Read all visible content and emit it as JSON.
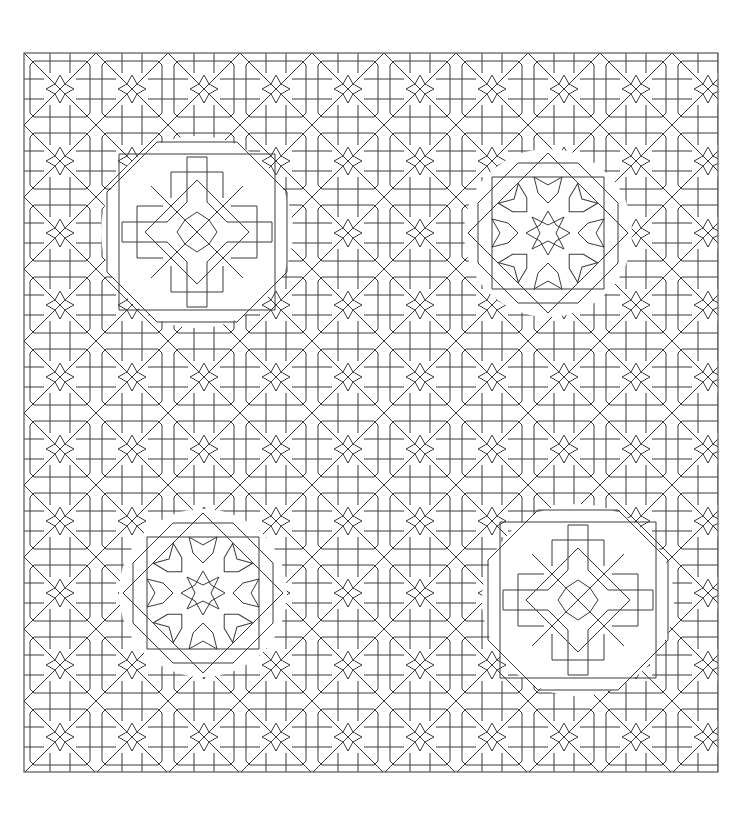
{
  "artwork": {
    "kind": "islamic-geometric-line-art",
    "background": "#ffffff",
    "stroke_color": "#3a3a3a",
    "frame": {
      "x": 24,
      "y": 53,
      "width": 694,
      "height": 719,
      "color": "#555555"
    },
    "tile_period": 72,
    "rosettes": [
      {
        "name": "rosette-top-left",
        "style": "interlaced-cross",
        "cx": 197,
        "cy": 232
      },
      {
        "name": "rosette-top-right",
        "style": "eight-point-star",
        "cx": 548,
        "cy": 233
      },
      {
        "name": "rosette-bottom-left",
        "style": "eight-point-star",
        "cx": 203,
        "cy": 593
      },
      {
        "name": "rosette-bottom-right",
        "style": "interlaced-cross",
        "cx": 578,
        "cy": 600
      }
    ]
  }
}
